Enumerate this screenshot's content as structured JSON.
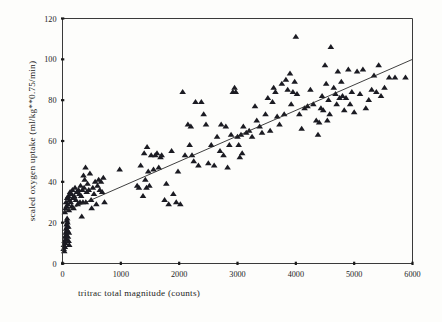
{
  "chart_data": {
    "type": "scatter",
    "title": "",
    "xlabel": "tritrac total magnitude (counts)",
    "ylabel": "scaled oxygen uptake (ml/kg**0.75/min)",
    "xlim": [
      0,
      6000
    ],
    "ylim": [
      0,
      120
    ],
    "xticks": [
      0,
      1000,
      2000,
      3000,
      4000,
      5000,
      6000
    ],
    "yticks": [
      0,
      20,
      40,
      60,
      80,
      100,
      120
    ],
    "xtick_labels": [
      "0",
      "1000",
      "2000",
      "3000",
      "4000",
      "5000",
      "6000"
    ],
    "ytick_labels": [
      "0",
      "20",
      "40",
      "60",
      "80",
      "100",
      "120"
    ],
    "grid": false,
    "legend": "none",
    "marker": "triangle",
    "marker_color": "#1b1b22",
    "series": [
      {
        "name": "subjects",
        "marker": "triangle",
        "points": [
          [
            20,
            7
          ],
          [
            25,
            9
          ],
          [
            30,
            6
          ],
          [
            35,
            11
          ],
          [
            40,
            8
          ],
          [
            45,
            13
          ],
          [
            50,
            10
          ],
          [
            55,
            15
          ],
          [
            60,
            12
          ],
          [
            62,
            17
          ],
          [
            65,
            14
          ],
          [
            70,
            19
          ],
          [
            72,
            16
          ],
          [
            75,
            21
          ],
          [
            78,
            18
          ],
          [
            80,
            22
          ],
          [
            85,
            20
          ],
          [
            90,
            16
          ],
          [
            95,
            13
          ],
          [
            100,
            18
          ],
          [
            105,
            11
          ],
          [
            110,
            15
          ],
          [
            115,
            9
          ],
          [
            40,
            25
          ],
          [
            55,
            27
          ],
          [
            60,
            30
          ],
          [
            70,
            28
          ],
          [
            80,
            32
          ],
          [
            90,
            29
          ],
          [
            100,
            33
          ],
          [
            110,
            26
          ],
          [
            120,
            31
          ],
          [
            130,
            35
          ],
          [
            140,
            30
          ],
          [
            150,
            34
          ],
          [
            160,
            28
          ],
          [
            170,
            36
          ],
          [
            180,
            32
          ],
          [
            190,
            27
          ],
          [
            200,
            33
          ],
          [
            215,
            37
          ],
          [
            230,
            31
          ],
          [
            245,
            35
          ],
          [
            260,
            29
          ],
          [
            275,
            36
          ],
          [
            290,
            34
          ],
          [
            300,
            30
          ],
          [
            310,
            38
          ],
          [
            320,
            33
          ],
          [
            330,
            23
          ],
          [
            340,
            36
          ],
          [
            350,
            30
          ],
          [
            360,
            43
          ],
          [
            370,
            37
          ],
          [
            380,
            41
          ],
          [
            395,
            47
          ],
          [
            400,
            30
          ],
          [
            415,
            35
          ],
          [
            430,
            39
          ],
          [
            450,
            36
          ],
          [
            470,
            44
          ],
          [
            490,
            31
          ],
          [
            500,
            27
          ],
          [
            520,
            37
          ],
          [
            540,
            34
          ],
          [
            560,
            40
          ],
          [
            580,
            29
          ],
          [
            600,
            38
          ],
          [
            620,
            41
          ],
          [
            640,
            36
          ],
          [
            660,
            40
          ],
          [
            680,
            35
          ],
          [
            700,
            42
          ],
          [
            720,
            30
          ],
          [
            980,
            46
          ],
          [
            1280,
            38
          ],
          [
            1310,
            37
          ],
          [
            1340,
            48
          ],
          [
            1380,
            33
          ],
          [
            1400,
            54
          ],
          [
            1420,
            41
          ],
          [
            1440,
            37
          ],
          [
            1450,
            57
          ],
          [
            1470,
            45
          ],
          [
            1490,
            38
          ],
          [
            1520,
            53
          ],
          [
            1560,
            46
          ],
          [
            1590,
            53
          ],
          [
            1620,
            54
          ],
          [
            1650,
            47
          ],
          [
            1680,
            52
          ],
          [
            1700,
            53
          ],
          [
            1750,
            31
          ],
          [
            1780,
            39
          ],
          [
            1820,
            29
          ],
          [
            1870,
            55
          ],
          [
            1900,
            34
          ],
          [
            1950,
            30
          ],
          [
            1980,
            45
          ],
          [
            2020,
            29
          ],
          [
            2060,
            84
          ],
          [
            2100,
            53
          ],
          [
            2150,
            68
          ],
          [
            2180,
            58
          ],
          [
            2200,
            67
          ],
          [
            2220,
            53
          ],
          [
            2250,
            50
          ],
          [
            2280,
            79
          ],
          [
            2330,
            48
          ],
          [
            2380,
            79
          ],
          [
            2420,
            73
          ],
          [
            2460,
            68
          ],
          [
            2500,
            49
          ],
          [
            2550,
            58
          ],
          [
            2600,
            48
          ],
          [
            2650,
            62
          ],
          [
            2700,
            55
          ],
          [
            2720,
            68
          ],
          [
            2760,
            53
          ],
          [
            2800,
            67
          ],
          [
            2830,
            47
          ],
          [
            2860,
            58
          ],
          [
            2890,
            63
          ],
          [
            2920,
            84
          ],
          [
            2950,
            86
          ],
          [
            2970,
            84
          ],
          [
            3000,
            62
          ],
          [
            3020,
            58
          ],
          [
            3040,
            52
          ],
          [
            3060,
            63
          ],
          [
            3080,
            54
          ],
          [
            3100,
            67
          ],
          [
            3150,
            64
          ],
          [
            3200,
            65
          ],
          [
            3250,
            62
          ],
          [
            3300,
            77
          ],
          [
            3330,
            70
          ],
          [
            3380,
            67
          ],
          [
            3420,
            64
          ],
          [
            3480,
            73
          ],
          [
            3520,
            81
          ],
          [
            3560,
            65
          ],
          [
            3600,
            79
          ],
          [
            3620,
            86
          ],
          [
            3650,
            84
          ],
          [
            3680,
            72
          ],
          [
            3720,
            68
          ],
          [
            3760,
            88
          ],
          [
            3800,
            73
          ],
          [
            3830,
            90
          ],
          [
            3860,
            85
          ],
          [
            3900,
            93
          ],
          [
            3920,
            78
          ],
          [
            3950,
            84
          ],
          [
            3980,
            89
          ],
          [
            4000,
            111
          ],
          [
            4020,
            83
          ],
          [
            4060,
            73
          ],
          [
            4100,
            66
          ],
          [
            4150,
            76
          ],
          [
            4200,
            77
          ],
          [
            4250,
            85
          ],
          [
            4300,
            78
          ],
          [
            4350,
            70
          ],
          [
            4380,
            63
          ],
          [
            4400,
            69
          ],
          [
            4430,
            76
          ],
          [
            4450,
            82
          ],
          [
            4470,
            75
          ],
          [
            4500,
            97
          ],
          [
            4520,
            88
          ],
          [
            4540,
            70
          ],
          [
            4560,
            80
          ],
          [
            4580,
            73
          ],
          [
            4600,
            106
          ],
          [
            4650,
            86
          ],
          [
            4680,
            83
          ],
          [
            4700,
            78
          ],
          [
            4720,
            94
          ],
          [
            4750,
            81
          ],
          [
            4780,
            89
          ],
          [
            4800,
            82
          ],
          [
            4830,
            75
          ],
          [
            4860,
            81
          ],
          [
            4900,
            95
          ],
          [
            4930,
            78
          ],
          [
            4960,
            84
          ],
          [
            5000,
            74
          ],
          [
            5050,
            94
          ],
          [
            5100,
            83
          ],
          [
            5150,
            95
          ],
          [
            5200,
            76
          ],
          [
            5250,
            80
          ],
          [
            5300,
            85
          ],
          [
            5340,
            92
          ],
          [
            5380,
            84
          ],
          [
            5420,
            97
          ],
          [
            5460,
            82
          ],
          [
            5520,
            86
          ],
          [
            5600,
            91
          ],
          [
            5700,
            91
          ],
          [
            5880,
            91
          ]
        ]
      }
    ],
    "regression_line": {
      "x0": 0,
      "y0": 25,
      "x1": 6000,
      "y1": 100,
      "color": "#2a2a2a"
    }
  }
}
